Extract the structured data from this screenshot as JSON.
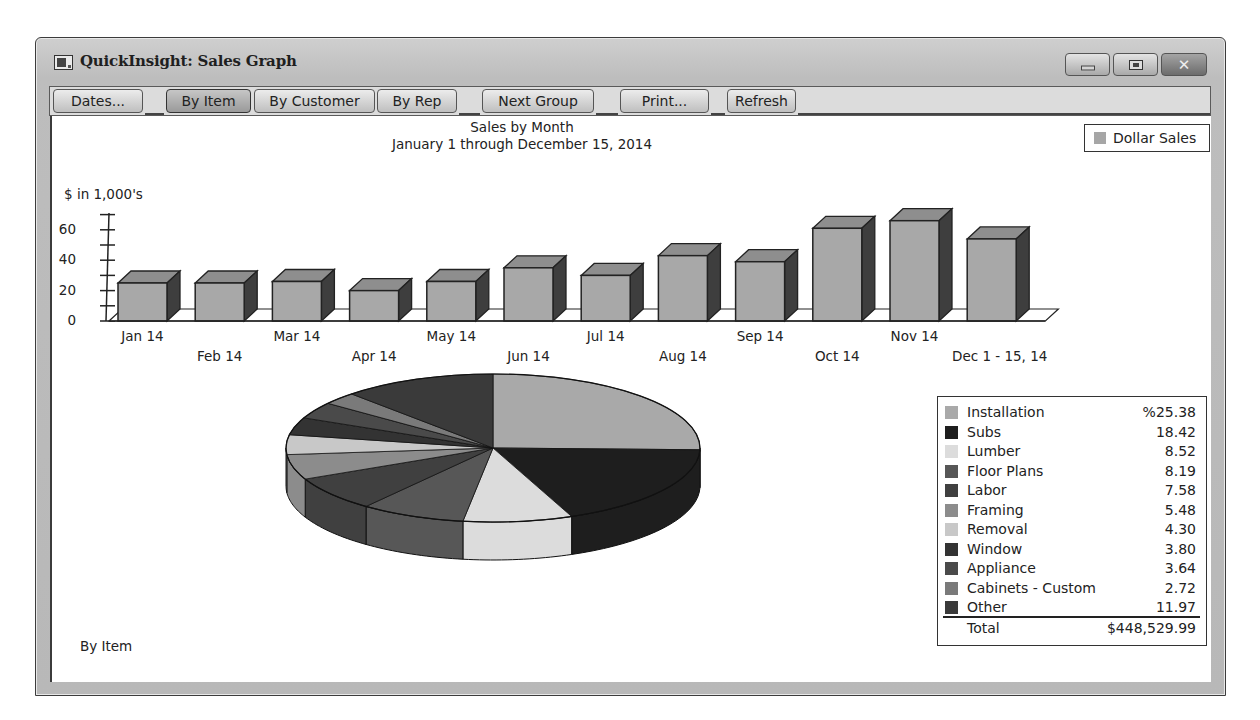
{
  "window": {
    "title": "QuickInsight: Sales Graph",
    "controls": {
      "minimize": "minimize-icon",
      "maximize": "maximize-icon",
      "close": "close-icon"
    }
  },
  "toolbar": {
    "buttons": [
      {
        "label": "Dates...",
        "x": 3,
        "w": 90
      },
      {
        "label": "By Item",
        "x": 116,
        "w": 85,
        "active": true
      },
      {
        "label": "By Customer",
        "x": 204,
        "w": 121
      },
      {
        "label": "By Rep",
        "x": 327,
        "w": 80
      },
      {
        "label": "Next Group",
        "x": 432,
        "w": 112
      },
      {
        "label": "Print...",
        "x": 570,
        "w": 89
      },
      {
        "label": "Refresh",
        "x": 677,
        "w": 69
      }
    ]
  },
  "bar_chart": {
    "title": "Sales by Month",
    "subtitle": "January 1 through December 15, 2014",
    "ylabel": "$ in 1,000's",
    "legend": "Dollar Sales",
    "yticks": [
      "60",
      "40",
      "20",
      "0"
    ]
  },
  "pie_chart": {
    "title": "Sales Summary",
    "subtitle": "January 1 through December 15, 2014",
    "legend": [
      {
        "name": "Installation",
        "value": "%25.38",
        "color": "#a9a9a9"
      },
      {
        "name": "Subs",
        "value": "18.42",
        "color": "#1e1e1e"
      },
      {
        "name": "Lumber",
        "value": "8.52",
        "color": "#dcdcdc"
      },
      {
        "name": "Floor Plans",
        "value": "8.19",
        "color": "#575757"
      },
      {
        "name": "Labor",
        "value": "7.58",
        "color": "#404040"
      },
      {
        "name": "Framing",
        "value": "5.48",
        "color": "#8c8c8c"
      },
      {
        "name": "Removal",
        "value": "4.30",
        "color": "#c8c8c8"
      },
      {
        "name": "Window",
        "value": "3.80",
        "color": "#333333"
      },
      {
        "name": "Appliance",
        "value": "3.64",
        "color": "#4a4a4a"
      },
      {
        "name": "Cabinets - Custom",
        "value": "2.72",
        "color": "#7a7a7a"
      },
      {
        "name": "Other",
        "value": "11.97",
        "color": "#3a3a3a"
      }
    ],
    "total_label": "Total",
    "total_value": "$448,529.99"
  },
  "footer": {
    "group_label": "By Item"
  },
  "chart_data": [
    {
      "type": "bar",
      "title": "Sales by Month",
      "subtitle": "January 1 through December 15, 2014",
      "xlabel": "",
      "ylabel": "$ in 1,000's",
      "categories": [
        "Jan 14",
        "Feb 14",
        "Mar 14",
        "Apr 14",
        "May 14",
        "Jun 14",
        "Jul 14",
        "Aug 14",
        "Sep 14",
        "Oct 14",
        "Nov 14",
        "Dec 1 - 15, 14"
      ],
      "series": [
        {
          "name": "Dollar Sales",
          "values": [
            25,
            25,
            26,
            20,
            26,
            35,
            30,
            43,
            39,
            61,
            66,
            54
          ]
        }
      ],
      "ylim": [
        0,
        70
      ],
      "yticks": [
        0,
        20,
        40,
        60
      ],
      "grid": false,
      "legend_position": "top-right",
      "style": "3d"
    },
    {
      "type": "pie",
      "title": "Sales Summary",
      "subtitle": "January 1 through December 15, 2014",
      "categories": [
        "Installation",
        "Subs",
        "Lumber",
        "Floor Plans",
        "Labor",
        "Framing",
        "Removal",
        "Window",
        "Appliance",
        "Cabinets - Custom",
        "Other"
      ],
      "values": [
        25.38,
        18.42,
        8.52,
        8.19,
        7.58,
        5.48,
        4.3,
        3.8,
        3.64,
        2.72,
        11.97
      ],
      "unit": "%",
      "total": "$448,529.99",
      "legend_position": "right",
      "style": "3d"
    }
  ]
}
